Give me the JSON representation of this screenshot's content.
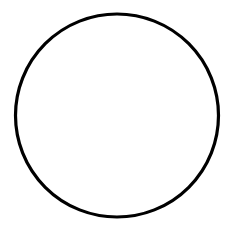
{
  "diagram": {
    "background": "#ffffff",
    "shapes": [
      {
        "type": "circle",
        "cx": 117,
        "cy": 115.5,
        "r": 101.5,
        "stroke": "#000000",
        "stroke_width": 3.2,
        "fill": "none"
      }
    ]
  }
}
